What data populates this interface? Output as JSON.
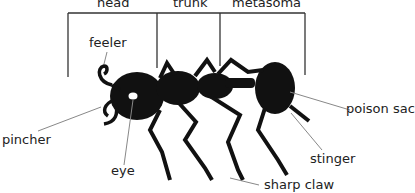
{
  "diagram": {
    "sections": [
      {
        "label": "head"
      },
      {
        "label": "trunk"
      },
      {
        "label": "metasoma"
      }
    ],
    "labels": {
      "feeler": "feeler",
      "pincher": "pincher",
      "eye": "eye",
      "poison_sac": "poison sac",
      "stinger": "stinger",
      "sharp_claw": "sharp claw"
    },
    "colors": {
      "ant": "#111111",
      "bracket_line": "#333333",
      "leader_line": "#888888",
      "text": "#222222"
    }
  }
}
